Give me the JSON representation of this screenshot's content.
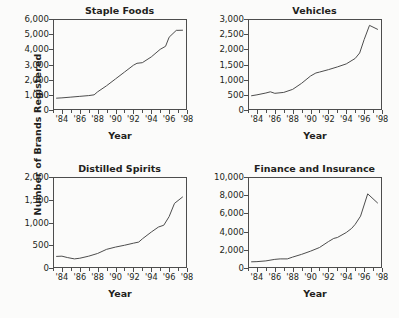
{
  "figure": {
    "ylabel": "Number of Brands Registered",
    "xlabel": "Year",
    "background": "#fbfbfa",
    "line_color": "#4d4d4d",
    "text_color": "#231f20"
  },
  "chart_data": [
    {
      "type": "line",
      "title": "Staple Foods",
      "xlabel": "Year",
      "ylabel": "Number of Brands Registered",
      "xlim": [
        1983,
        1998
      ],
      "ylim": [
        0,
        6000
      ],
      "yticks": [
        0,
        1000,
        2000,
        3000,
        4000,
        5000,
        6000
      ],
      "ytick_labels": [
        "0",
        "1,000",
        "2,000",
        "3,000",
        "4,000",
        "5,000",
        "6,000"
      ],
      "xticks": [
        1984,
        1986,
        1988,
        1990,
        1992,
        1994,
        1996,
        1998
      ],
      "xtick_labels": [
        "'84",
        "'86",
        "'88",
        "'90",
        "'92",
        "'94",
        "'96",
        "'98"
      ],
      "xminor_step": 1,
      "grid": false,
      "legend": "none",
      "x": [
        1983.4,
        1984,
        1985,
        1986,
        1987,
        1987.6,
        1988,
        1989,
        1990,
        1991,
        1992,
        1992.4,
        1993,
        1994,
        1995,
        1995.6,
        1996,
        1996.8,
        1997.5
      ],
      "values": [
        780,
        800,
        850,
        900,
        950,
        1000,
        1200,
        1600,
        2050,
        2500,
        2950,
        3080,
        3120,
        3500,
        4000,
        4200,
        4800,
        5250,
        5260
      ]
    },
    {
      "type": "line",
      "title": "Vehicles",
      "xlabel": "Year",
      "ylabel": "Number of Brands Registered",
      "xlim": [
        1983,
        1998
      ],
      "ylim": [
        0,
        3000
      ],
      "yticks": [
        0,
        500,
        1000,
        1500,
        2000,
        2500,
        3000
      ],
      "ytick_labels": [
        "0",
        "500",
        "1,000",
        "1,500",
        "2,000",
        "2,500",
        "3,000"
      ],
      "xticks": [
        1984,
        1986,
        1988,
        1990,
        1992,
        1994,
        1996,
        1998
      ],
      "xtick_labels": [
        "'84",
        "'86",
        "'88",
        "'90",
        "'92",
        "'94",
        "'96",
        "'98"
      ],
      "xminor_step": 1,
      "grid": false,
      "legend": "none",
      "x": [
        1983.4,
        1984,
        1985,
        1985.5,
        1986,
        1987,
        1988,
        1989,
        1990,
        1990.6,
        1991,
        1992,
        1993,
        1994,
        1995,
        1995.5,
        1996,
        1996.6,
        1997.5
      ],
      "values": [
        470,
        500,
        560,
        600,
        550,
        580,
        680,
        880,
        1120,
        1220,
        1250,
        1330,
        1420,
        1520,
        1700,
        1880,
        2320,
        2790,
        2660
      ]
    },
    {
      "type": "line",
      "title": "Distilled Spirits",
      "xlabel": "Year",
      "ylabel": "Number of Brands Registered",
      "xlim": [
        1983,
        1998
      ],
      "ylim": [
        0,
        2000
      ],
      "yticks": [
        0,
        500,
        1000,
        1500,
        2000
      ],
      "ytick_labels": [
        "0",
        "500",
        "1,000",
        "1,500",
        "2,000"
      ],
      "xticks": [
        1984,
        1986,
        1988,
        1990,
        1992,
        1994,
        1996,
        1998
      ],
      "xtick_labels": [
        "'84",
        "'86",
        "'88",
        "'90",
        "'92",
        "'94",
        "'96",
        "'98"
      ],
      "xminor_step": 1,
      "grid": false,
      "legend": "none",
      "x": [
        1983.4,
        1984,
        1984.6,
        1985.4,
        1986,
        1987,
        1988,
        1989,
        1990,
        1991,
        1992,
        1992.6,
        1993,
        1994,
        1994.8,
        1995.4,
        1996,
        1996.6,
        1997.5
      ],
      "values": [
        255,
        260,
        230,
        200,
        215,
        260,
        320,
        410,
        460,
        500,
        545,
        570,
        640,
        790,
        900,
        940,
        1130,
        1420,
        1560
      ]
    },
    {
      "type": "line",
      "title": "Finance and Insurance",
      "xlabel": "Year",
      "ylabel": "Number of Brands Registered",
      "xlim": [
        1983,
        1998
      ],
      "ylim": [
        0,
        10000
      ],
      "yticks": [
        0,
        2000,
        4000,
        6000,
        8000,
        10000
      ],
      "ytick_labels": [
        "0",
        "2,000",
        "4,000",
        "6,000",
        "8,000",
        "10,000"
      ],
      "xticks": [
        1984,
        1986,
        1988,
        1990,
        1992,
        1994,
        1996,
        1998
      ],
      "xtick_labels": [
        "'84",
        "'86",
        "'88",
        "'90",
        "'92",
        "'94",
        "'96",
        "'98"
      ],
      "xminor_step": 1,
      "grid": false,
      "legend": "none",
      "x": [
        1983.4,
        1984,
        1985,
        1986,
        1986.6,
        1987.4,
        1988,
        1989,
        1990,
        1991,
        1992,
        1992.6,
        1993,
        1994,
        1994.6,
        1995,
        1995.6,
        1996.4,
        1997.5
      ],
      "values": [
        680,
        700,
        780,
        950,
        1000,
        1000,
        1200,
        1500,
        1850,
        2250,
        2900,
        3250,
        3350,
        3900,
        4350,
        4800,
        5700,
        8150,
        7150
      ]
    }
  ]
}
